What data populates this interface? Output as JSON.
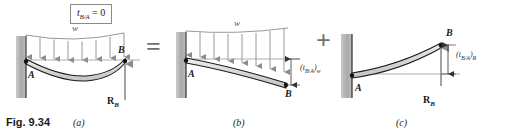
{
  "figure": {
    "caption_number": "Fig. 9.34",
    "title_condition": "t",
    "condition_sub": "B/A",
    "condition_eq": "= 0"
  },
  "operators": {
    "equals": "=",
    "plus": "+"
  },
  "panels": [
    {
      "id": "a",
      "caption": "(a)",
      "load_label": "w",
      "point_a": "A",
      "point_b": "B",
      "reaction_label": "R",
      "reaction_sub": "B",
      "description": "propped cantilever with distributed load and reaction at B",
      "arrow_count": 8
    },
    {
      "id": "b",
      "caption": "(b)",
      "load_label": "w",
      "point_a": "A",
      "point_b": "B",
      "deflection": "(t",
      "deflection_sub": "B/A",
      "deflection_close": ")",
      "deflection_sub2": "w",
      "description": "cantilever with distributed load only",
      "arrow_count": 8
    },
    {
      "id": "c",
      "caption": "(c)",
      "point_a": "A",
      "point_b": "B",
      "reaction_label": "R",
      "reaction_sub": "B",
      "deflection": "(t",
      "deflection_sub": "B/A",
      "deflection_close": ")",
      "deflection_sub2": "R",
      "description": "cantilever with redundant reaction only"
    }
  ],
  "colors": {
    "wall_fill": "#a8a8a8",
    "beam_fill": "#d9d9d9",
    "beam_stroke": "#1a1a1a",
    "arrow_gray": "#8c8c8c",
    "ref_line": "#9a9a9a",
    "operator_gray": "#6f6f6f",
    "text": "#1a1a1a"
  }
}
